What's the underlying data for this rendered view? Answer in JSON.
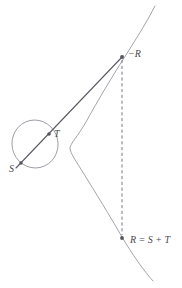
{
  "figure": {
    "kind": "elliptic-curve-point-addition",
    "background_color": "#ffffff",
    "curve_color": "#9a9aa2",
    "chord_color": "#5a5a66",
    "dashed_color": "#7a7a86",
    "point_color": "#55555f",
    "label_color": "#4a4a52",
    "font_size_px": 10
  },
  "labels": {
    "point_s": "S",
    "point_t": "T",
    "point_minus_r": "−R",
    "point_r": "R = S + T"
  },
  "points": {
    "s": {
      "x": 21,
      "y": 163
    },
    "t": {
      "x": 49,
      "y": 134
    },
    "minus_r": {
      "x": 122,
      "y": 57
    },
    "r": {
      "x": 122,
      "y": 238
    }
  },
  "label_positions": {
    "s": {
      "x": 9,
      "y": 172
    },
    "t": {
      "x": 54,
      "y": 136
    },
    "minus_r": {
      "x": 128,
      "y": 56
    },
    "r": {
      "x": 130,
      "y": 243
    }
  },
  "geometry": {
    "oval": {
      "cx": 35,
      "cy": 144,
      "rx": 23,
      "ry": 24,
      "rotation": -12
    },
    "chord_start": {
      "x": 17,
      "y": 167
    },
    "chord_end": {
      "x": 122,
      "y": 57
    },
    "secant_top": {
      "x": 155,
      "y": 6
    },
    "secant_bottom": {
      "x": 153,
      "y": 281
    },
    "dashed_line": {
      "x": 122,
      "y1": 59,
      "y2": 236
    },
    "right_branch_leftmost": {
      "x": 70,
      "y": 147
    }
  }
}
